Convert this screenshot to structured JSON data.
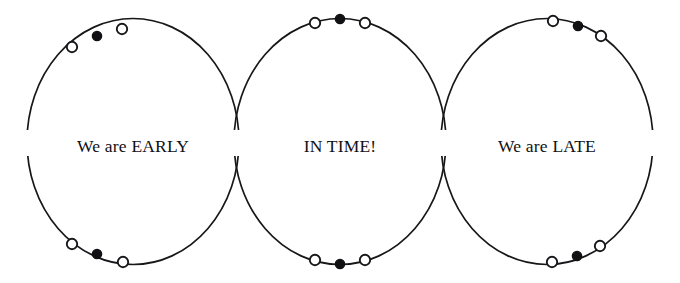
{
  "figure": {
    "background_color": "#ffffff",
    "stroke_color": "#17171a",
    "marker_open_fill": "#ffffff",
    "marker_filled_fill": "#111114",
    "width": 680,
    "height": 283
  },
  "orbits": [
    {
      "id": "orbit-early",
      "label": "We are EARLY",
      "label_x": 133,
      "label_y": 152,
      "center_x": 133,
      "center_y": 141.5,
      "radius_x": 106,
      "radius_y": 123,
      "marker_group_top": {
        "position": "left-of-apex",
        "markers": [
          {
            "type": "open",
            "x": 72,
            "y": 47
          },
          {
            "type": "filled",
            "x": 97,
            "y": 36
          },
          {
            "type": "open",
            "x": 122,
            "y": 29
          }
        ]
      },
      "marker_group_bottom": {
        "position": "left-of-nadir",
        "markers": [
          {
            "type": "open",
            "x": 72,
            "y": 244
          },
          {
            "type": "filled",
            "x": 97,
            "y": 254
          },
          {
            "type": "open",
            "x": 123,
            "y": 262
          }
        ]
      }
    },
    {
      "id": "orbit-in-time",
      "label": "IN TIME!",
      "label_x": 340,
      "label_y": 152,
      "center_x": 340,
      "center_y": 141.5,
      "radius_x": 106,
      "radius_y": 123,
      "marker_group_top": {
        "position": "at-apex",
        "markers": [
          {
            "type": "open",
            "x": 315,
            "y": 23
          },
          {
            "type": "filled",
            "x": 340,
            "y": 19
          },
          {
            "type": "open",
            "x": 365,
            "y": 23
          }
        ]
      },
      "marker_group_bottom": {
        "position": "at-nadir",
        "markers": [
          {
            "type": "open",
            "x": 315,
            "y": 260
          },
          {
            "type": "filled",
            "x": 340,
            "y": 264
          },
          {
            "type": "open",
            "x": 365,
            "y": 260
          }
        ]
      }
    },
    {
      "id": "orbit-late",
      "label": "We are LATE",
      "label_x": 547,
      "label_y": 152,
      "center_x": 547,
      "center_y": 141.5,
      "radius_x": 106,
      "radius_y": 123,
      "marker_group_top": {
        "position": "right-of-apex",
        "markers": [
          {
            "type": "open",
            "x": 553,
            "y": 21
          },
          {
            "type": "filled",
            "x": 578,
            "y": 26
          },
          {
            "type": "open",
            "x": 601,
            "y": 36
          }
        ]
      },
      "marker_group_bottom": {
        "position": "right-of-nadir",
        "markers": [
          {
            "type": "open",
            "x": 552,
            "y": 262
          },
          {
            "type": "filled",
            "x": 577,
            "y": 256
          },
          {
            "type": "open",
            "x": 600,
            "y": 246
          }
        ]
      }
    }
  ],
  "marker_geometry": {
    "open_radius": 5.2,
    "filled_radius": 4.6
  },
  "label_band": {
    "top": 130,
    "height": 26
  }
}
